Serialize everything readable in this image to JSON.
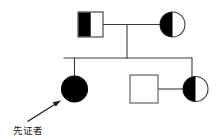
{
  "figure": {
    "kind": "pedigree-chart",
    "title": "",
    "background_color": "#ffffff",
    "line_color": "#3a3a3a",
    "fill_color": "#000000",
    "unaffected_fill": "#ffffff",
    "text_color": "#1a1a1a"
  },
  "legend": {
    "proband_label": "先证者"
  },
  "generations": [
    {
      "id": "I",
      "individuals": [
        {
          "id": "I-1",
          "name": "father",
          "shape": "square",
          "sex": "male",
          "fill": "left-half-filled",
          "status": "carrier",
          "cx": 90.5,
          "cy": 24.5,
          "size": 25
        },
        {
          "id": "I-2",
          "name": "mother",
          "shape": "circle",
          "sex": "female",
          "fill": "left-half-filled",
          "status": "carrier",
          "cx": 172.5,
          "cy": 24.5,
          "size": 25
        }
      ]
    },
    {
      "id": "II",
      "individuals": [
        {
          "id": "II-1",
          "name": "proband-daughter",
          "shape": "circle",
          "sex": "female",
          "fill": "filled",
          "status": "affected",
          "cx": 74.5,
          "cy": 88.5,
          "size": 26,
          "is_proband": true
        },
        {
          "id": "II-2",
          "name": "son-in-law",
          "shape": "square",
          "sex": "male",
          "fill": "empty",
          "status": "unaffected",
          "cx": 144,
          "cy": 89,
          "size": 28
        },
        {
          "id": "II-3",
          "name": "daughter",
          "shape": "circle",
          "sex": "female",
          "fill": "left-half-filled",
          "status": "carrier",
          "cx": 195.5,
          "cy": 89,
          "size": 25
        }
      ]
    }
  ],
  "connections": [
    {
      "name": "mating-line-gen1",
      "type": "mating",
      "from": "I-1",
      "to": "I-2",
      "y": 24.5,
      "x1": 103,
      "x2": 160
    },
    {
      "name": "descent-line-gen1",
      "type": "descent",
      "x": 127,
      "y1": 24.5,
      "y2": 58
    },
    {
      "name": "sibship-line",
      "type": "sibship",
      "y": 58,
      "x1": 64,
      "x2": 192
    },
    {
      "name": "drop-line-proband",
      "type": "drop",
      "x": 74.5,
      "y1": 58,
      "y2": 76
    },
    {
      "name": "drop-line-daughter",
      "type": "drop",
      "x": 192,
      "y1": 58,
      "y2": 77
    },
    {
      "name": "mating-line-gen2",
      "type": "mating",
      "from": "II-2",
      "to": "II-3",
      "y": 89,
      "x1": 158,
      "x2": 184
    }
  ],
  "annotations": [
    {
      "name": "proband-arrow",
      "type": "arrow",
      "label": "先证者",
      "tail_x": 28,
      "tail_y": 121,
      "head_x": 60,
      "head_y": 101,
      "label_x": 13,
      "label_y": 134
    }
  ]
}
